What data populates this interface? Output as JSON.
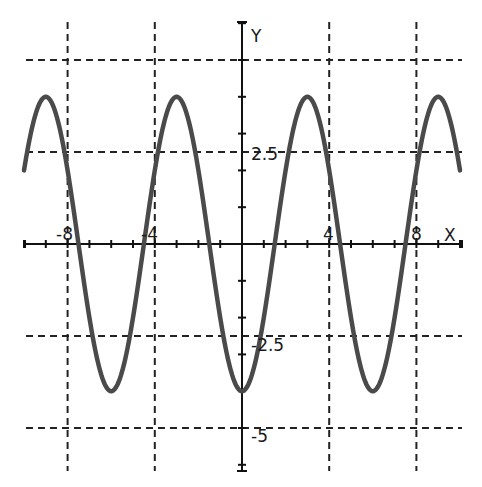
{
  "chart_data": {
    "type": "line",
    "title": "",
    "xlabel": "X",
    "ylabel": "Y",
    "function": "y = -4cos(pi*x/3)",
    "xlim": [
      -10,
      10
    ],
    "ylim": [
      -6.1,
      6.0
    ],
    "grid": true,
    "grid_style": "dashed",
    "x_gridlines": [
      -8,
      -4,
      4,
      8
    ],
    "y_gridlines": [
      5,
      2.5,
      -2.5,
      -5
    ],
    "x_tick_labels": [
      "-8",
      "-4",
      "4",
      "8"
    ],
    "y_tick_labels": [
      "2.5",
      "-2.5",
      "-5"
    ],
    "series": [
      {
        "name": "y = -4cos(πx/3)",
        "color": "#4a4a4a",
        "x": [
          -10,
          -9,
          -7.5,
          -6,
          -4.5,
          -3,
          -1.5,
          0,
          1.5,
          3,
          4.5,
          6,
          7.5,
          9,
          10
        ],
        "y": [
          2,
          4,
          0,
          -4,
          0,
          4,
          0,
          -4,
          0,
          4,
          0,
          -4,
          0,
          4,
          2
        ]
      }
    ],
    "extrema": {
      "maxima": [
        [
          -9,
          4
        ],
        [
          -3,
          4
        ],
        [
          3,
          4
        ],
        [
          9,
          4
        ]
      ],
      "minima": [
        [
          -6,
          -4
        ],
        [
          0,
          -4
        ],
        [
          6,
          -4
        ]
      ]
    }
  },
  "axes": {
    "x_label": "X",
    "y_label": "Y",
    "labels": {
      "x_m8": "-8",
      "x_m4": "-4",
      "x_4": "4",
      "x_8": "8",
      "y_2_5": "2.5",
      "y_m2_5": "-2.5",
      "y_m5": "-5"
    }
  }
}
